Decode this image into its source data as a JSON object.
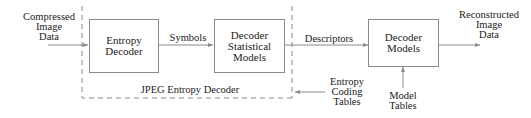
{
  "diagram": {
    "title_region": "JPEG Entropy Decoder",
    "inputs": {
      "compressed": "Compressed\nImage\nData",
      "entropy_tables": "Entropy\nCoding\nTables",
      "model_tables": "Model\nTables"
    },
    "boxes": {
      "entropy_decoder": "Entropy\nDecoder",
      "decoder_stat_models": "Decoder\nStatistical\nModels",
      "decoder_models": "Decoder\nModels"
    },
    "edges": {
      "symbols": "Symbols",
      "descriptors": "Descriptors"
    },
    "outputs": {
      "reconstructed": "Reconstructed\nImage\nData"
    },
    "colors": {
      "stroke": "#8a8a8a",
      "text": "#222222"
    }
  }
}
